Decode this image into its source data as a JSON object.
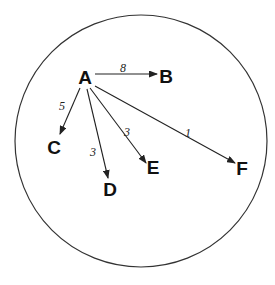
{
  "diagram": {
    "type": "directed-weighted-graph",
    "boundary": {
      "shape": "circle",
      "cx": 141,
      "cy": 141,
      "r": 126,
      "color": "#333333"
    },
    "nodes": [
      {
        "id": "A",
        "label": "A",
        "x": 85,
        "y": 84
      },
      {
        "id": "B",
        "label": "B",
        "x": 166,
        "y": 83
      },
      {
        "id": "C",
        "label": "C",
        "x": 54,
        "y": 154
      },
      {
        "id": "D",
        "label": "D",
        "x": 110,
        "y": 196
      },
      {
        "id": "E",
        "label": "E",
        "x": 153,
        "y": 174
      },
      {
        "id": "F",
        "label": "F",
        "x": 242,
        "y": 175
      }
    ],
    "edges": [
      {
        "from": "A",
        "to": "B",
        "weight": "8",
        "x1": 95,
        "y1": 74,
        "x2": 157,
        "y2": 74,
        "lx": 123,
        "ly": 72
      },
      {
        "from": "A",
        "to": "C",
        "weight": "5",
        "x1": 80,
        "y1": 88,
        "x2": 60,
        "y2": 134,
        "lx": 62,
        "ly": 110
      },
      {
        "from": "A",
        "to": "D",
        "weight": "3",
        "x1": 87,
        "y1": 89,
        "x2": 108,
        "y2": 178,
        "lx": 93,
        "ly": 156
      },
      {
        "from": "A",
        "to": "E",
        "weight": "3",
        "x1": 90,
        "y1": 88,
        "x2": 146,
        "y2": 163,
        "lx": 127,
        "ly": 136
      },
      {
        "from": "A",
        "to": "F",
        "weight": "1",
        "x1": 95,
        "y1": 86,
        "x2": 235,
        "y2": 163,
        "lx": 188,
        "ly": 137
      }
    ]
  }
}
